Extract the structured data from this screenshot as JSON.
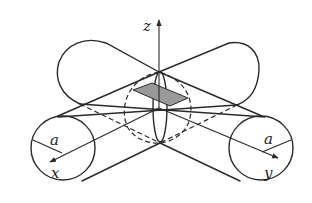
{
  "figure": {
    "labels": {
      "z_axis": "z",
      "x_axis": "x",
      "y_axis": "y",
      "radius_left": "a",
      "radius_right": "a"
    },
    "colors": {
      "line": "#2a2a2a",
      "shade": "#9a9a9a",
      "background": "#ffffff"
    }
  }
}
